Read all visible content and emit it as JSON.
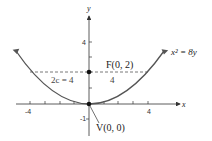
{
  "figure": {
    "equation": "x² = 8y",
    "focus_label": "F(0, 2)",
    "vertex_label": "V(0, 0)",
    "latus_rectum_label": "2c = 4",
    "half_width_label": "4",
    "x_axis_label": "x",
    "y_axis_label": "y",
    "x_ticks": {
      "neg": "-4",
      "pos": "4"
    },
    "y_ticks": {
      "pos": "4",
      "neg": "-1"
    },
    "colors": {
      "curve": "#555555",
      "axes": "#333333",
      "dashed": "#555555",
      "points": "#111111"
    }
  },
  "parabola": {
    "equation": "x^2 = 8y",
    "vertex": [
      0,
      0
    ],
    "focus": [
      0,
      2
    ],
    "focal_chord_y": 2,
    "focal_chord_x": [
      -4,
      4
    ],
    "x_range": [
      -5.1,
      5.1
    ]
  }
}
